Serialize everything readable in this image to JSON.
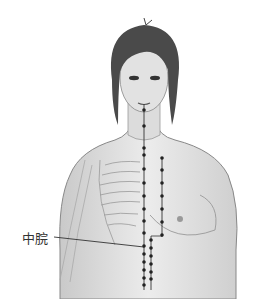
{
  "figure": {
    "labels": [
      {
        "text": "中脘",
        "x": 22,
        "y": 230
      }
    ],
    "meridians": [
      {
        "name": "midline",
        "x": 144,
        "y_start": 104,
        "y_end": 290,
        "points_y": [
          110,
          126,
          148,
          155,
          169,
          183,
          196,
          209,
          221,
          233,
          246,
          254,
          262,
          270,
          278,
          285
        ]
      },
      {
        "name": "right-chest-line",
        "x": 162,
        "y_start": 157,
        "y_end": 237,
        "points_y": [
          158,
          170,
          183,
          196,
          209,
          222,
          235
        ]
      },
      {
        "name": "lower-line",
        "x": 151,
        "y_start": 236,
        "y_end": 290,
        "points_y": [
          240,
          248,
          256,
          264,
          272,
          279
        ]
      }
    ],
    "leader_line": {
      "from": [
        54,
        237
      ],
      "to": [
        144,
        247
      ]
    },
    "colors": {
      "skin": "#e4e4e4",
      "shade": "#bdbdbd",
      "hair": "#4a4a4a",
      "line": "#333333",
      "point": "#222222"
    }
  }
}
